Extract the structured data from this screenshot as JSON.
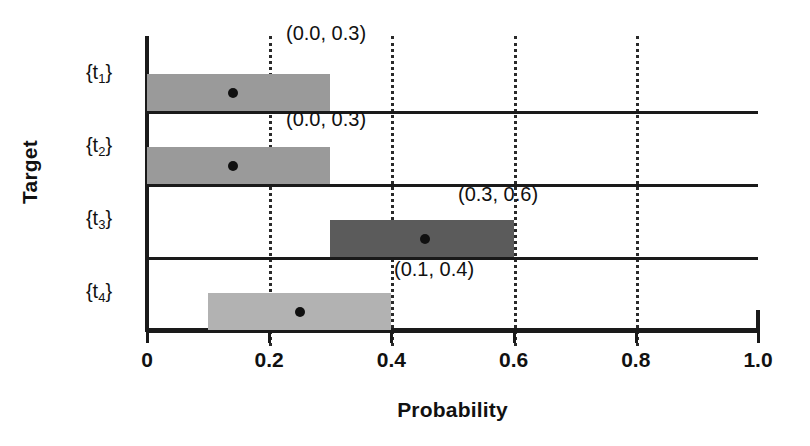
{
  "chart_data": {
    "type": "bar",
    "orientation": "horizontal",
    "title": "",
    "subtitle": "",
    "xlabel": "Probability",
    "ylabel": "Target",
    "xlim": [
      0.0,
      1.0
    ],
    "grid": true,
    "grid_axis": "x",
    "legend": null,
    "categories": [
      "{t₁}",
      "{t₂}",
      "{t₃}",
      "{t₄}"
    ],
    "xticks": [
      0.0,
      0.2,
      0.4,
      0.6,
      0.8,
      1.0
    ],
    "xtick_labels": [
      "0",
      "0.2",
      "0.4",
      "0.6",
      "0.8",
      "1.0"
    ],
    "intervals": [
      {
        "category": "{t₁}",
        "category_base": "t",
        "category_sub": "1",
        "lower": 0.0,
        "upper": 0.3,
        "point": 0.14,
        "annotation": "(0.0, 0.3)",
        "color": "#9a9a9a"
      },
      {
        "category": "{t₂}",
        "category_base": "t",
        "category_sub": "2",
        "lower": 0.0,
        "upper": 0.3,
        "point": 0.14,
        "annotation": "(0.0, 0.3)",
        "color": "#9a9a9a"
      },
      {
        "category": "{t₃}",
        "category_base": "t",
        "category_sub": "3",
        "lower": 0.3,
        "upper": 0.6,
        "point": 0.455,
        "annotation": "(0.3, 0.6)",
        "color": "#5b5b5b"
      },
      {
        "category": "{t₄}",
        "category_base": "t",
        "category_sub": "4",
        "lower": 0.1,
        "upper": 0.4,
        "point": 0.25,
        "annotation": "(0.1, 0.4)",
        "color": "#b2b2b2"
      }
    ]
  },
  "axes": {
    "x_title": "Probability",
    "y_title": "Target",
    "x_tick_0": "0",
    "x_tick_1": "0.2",
    "x_tick_2": "0.4",
    "x_tick_3": "0.6",
    "x_tick_4": "0.8",
    "x_tick_5": "1.0"
  },
  "colors": {
    "axis": "#1a1a1a",
    "grid": "#2a2a2a",
    "point": "#101010",
    "background": "#ffffff",
    "bar_light": "#b2b2b2",
    "bar_medium": "#9a9a9a",
    "bar_dark": "#5b5b5b"
  }
}
